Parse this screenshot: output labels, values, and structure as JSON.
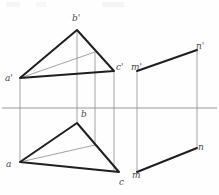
{
  "figure": {
    "type": "engineering-line-drawing",
    "canvas": {
      "width": 219,
      "height": 195
    },
    "colors": {
      "background": "#fefefe",
      "heavy_line": "#1f1f1f",
      "thin_line": "#8c8c8c",
      "projector_line": "#9a9a9a",
      "ground_line": "#8e8e8e",
      "label_text": "#4a4a4a"
    },
    "ground_line": {
      "name": "XY-axis",
      "y": 108,
      "x_start": 2,
      "x_end": 217
    }
  },
  "labels": {
    "a_front": "a'",
    "b_front": "b'",
    "c_front": "c'",
    "m_front": "m'",
    "n_front": "n'",
    "a_top": "a",
    "b_top": "b",
    "c_top": "c",
    "m_top": "m",
    "n_top": "n"
  },
  "label_positions": {
    "a_front": {
      "x": 5,
      "y": 74
    },
    "b_front": {
      "x": 72,
      "y": 14
    },
    "c_front": {
      "x": 116,
      "y": 63
    },
    "m_front": {
      "x": 131,
      "y": 63
    },
    "n_front": {
      "x": 196,
      "y": 42
    },
    "a_top": {
      "x": 6,
      "y": 160
    },
    "b_top": {
      "x": 81,
      "y": 110
    },
    "c_top": {
      "x": 119,
      "y": 178
    },
    "m_top": {
      "x": 132,
      "y": 171
    },
    "n_top": {
      "x": 198,
      "y": 143
    }
  },
  "geometry": {
    "frontal_triangle": {
      "name": "triangle-a'b'c'",
      "vertices": [
        {
          "id": "a'",
          "x": 20,
          "y": 78
        },
        {
          "id": "b'",
          "x": 77,
          "y": 30
        },
        {
          "id": "c'",
          "x": 114,
          "y": 71
        }
      ]
    },
    "horizontal_triangle": {
      "name": "triangle-abc",
      "vertices": [
        {
          "id": "a",
          "x": 20,
          "y": 162
        },
        {
          "id": "b",
          "x": 77,
          "y": 123
        },
        {
          "id": "c",
          "x": 119,
          "y": 172
        }
      ]
    },
    "frontal_auxiliary_line": {
      "name": "line-a'-to-d'",
      "from": {
        "x": 20,
        "y": 78
      },
      "to": {
        "x": 95,
        "y": 52
      }
    },
    "horizontal_auxiliary_line": {
      "name": "line-a-to-d",
      "from": {
        "x": 20,
        "y": 162
      },
      "to": {
        "x": 95,
        "y": 145
      }
    },
    "plane_front": {
      "name": "edge-m'n'",
      "from": {
        "x": 137,
        "y": 71
      },
      "to": {
        "x": 197,
        "y": 50
      }
    },
    "plane_top": {
      "name": "edge-mn",
      "from": {
        "x": 137,
        "y": 172
      },
      "to": {
        "x": 197,
        "y": 148
      }
    },
    "projectors": [
      {
        "name": "projector-a",
        "x": 20,
        "y1": 78,
        "y2": 162
      },
      {
        "name": "projector-b",
        "x": 77,
        "y1": 30,
        "y2": 123
      },
      {
        "name": "projector-d",
        "x": 95,
        "y1": 52,
        "y2": 145
      },
      {
        "name": "projector-c",
        "x": 114,
        "y1": 71,
        "y2": 172
      },
      {
        "name": "projector-m",
        "x": 137,
        "y1": 71,
        "y2": 172
      },
      {
        "name": "projector-n",
        "x": 197,
        "y1": 50,
        "y2": 148
      }
    ]
  }
}
